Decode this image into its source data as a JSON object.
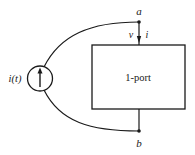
{
  "diagram": {
    "type": "circuit",
    "source": {
      "label": "i(t)",
      "kind": "current-source",
      "arrow_direction": "up"
    },
    "one_port": {
      "label": "1-port"
    },
    "terminals": [
      {
        "id": "a",
        "label": "a"
      },
      {
        "id": "b",
        "label": "b"
      }
    ],
    "port_variables": {
      "voltage": "v",
      "current": "i"
    },
    "colors": {
      "stroke": "#1a1a1a",
      "background": "#ffffff"
    }
  }
}
